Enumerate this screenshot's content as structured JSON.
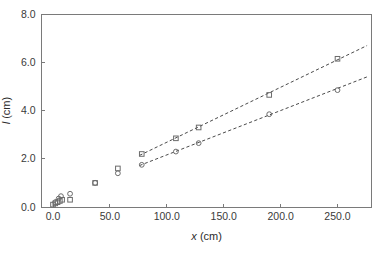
{
  "figure": {
    "background_color": "#ffffff",
    "frame_color": "#7a7a7a",
    "marker_color": "#6b6b6b",
    "line_color": "#4a4a4a"
  },
  "chart_data": {
    "type": "scatter",
    "title": "",
    "subtitle": "",
    "xlabel_var": "x",
    "xlabel_unit": "(cm)",
    "ylabel_var": "l",
    "ylabel_unit": "(cm)",
    "xlabel": "x (cm)",
    "ylabel": "l (cm)",
    "xlim": [
      -10,
      280
    ],
    "ylim": [
      0.0,
      8.0
    ],
    "xticks": [
      0,
      50,
      100,
      150,
      200,
      250
    ],
    "xticklabels": [
      "0.0",
      "50.0",
      "100.0",
      "150.0",
      "200.0",
      "250.0"
    ],
    "yticks": [
      0.0,
      2.0,
      4.0,
      6.0,
      8.0
    ],
    "yticklabels": [
      "0.0",
      "2.0",
      "4.0",
      "6.0",
      "8.0"
    ],
    "grid": false,
    "legend": "none",
    "series": [
      {
        "name": "square-series",
        "marker": "square",
        "x": [
          0,
          2,
          4,
          6,
          8,
          15,
          37,
          57,
          78,
          108,
          128,
          190,
          250
        ],
        "values": [
          0.1,
          0.15,
          0.2,
          0.25,
          0.3,
          0.3,
          1.0,
          1.6,
          2.2,
          2.85,
          3.3,
          4.65,
          6.15
        ]
      },
      {
        "name": "circle-series",
        "marker": "circle",
        "x": [
          2,
          5,
          7,
          15,
          37,
          57,
          78,
          108,
          128,
          190,
          250
        ],
        "values": [
          0.2,
          0.35,
          0.45,
          0.55,
          1.0,
          1.4,
          1.75,
          2.3,
          2.65,
          3.85,
          4.85
        ]
      }
    ],
    "fits": [
      {
        "name": "upper-fit-line",
        "style": "dashed",
        "x_start": 76,
        "x_end": 276,
        "y_start": 2.14,
        "y_end": 6.7
      },
      {
        "name": "lower-fit-line",
        "style": "dashed",
        "x_start": 76,
        "x_end": 276,
        "y_start": 1.72,
        "y_end": 5.4
      }
    ]
  }
}
